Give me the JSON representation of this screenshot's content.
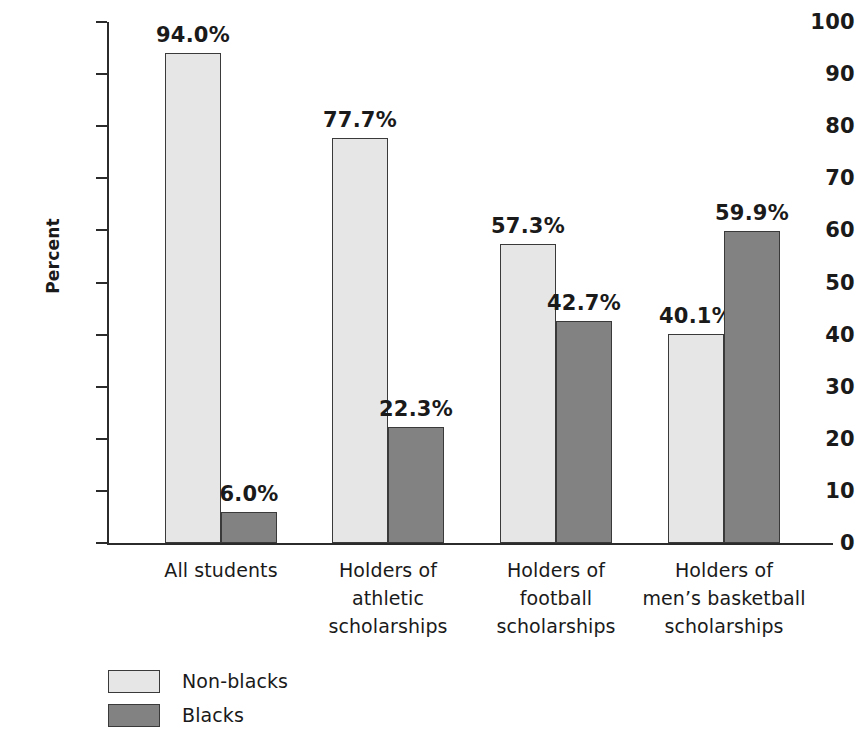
{
  "chart_data": {
    "type": "bar",
    "title": "",
    "xlabel": "",
    "ylabel": "Percent",
    "ylim": [
      0,
      100
    ],
    "ytick_step": 10,
    "yticks": [
      100,
      90,
      80,
      70,
      60,
      50,
      40,
      30,
      20,
      10,
      0
    ],
    "grid": false,
    "legend_position": "bottom-left",
    "value_label_suffix": "%",
    "categories": [
      "All students",
      "Holders of athletic scholarships",
      "Holders of football scholarships",
      "Holders of men’s basketball scholarships"
    ],
    "category_lines": [
      [
        "All students"
      ],
      [
        "Holders of",
        "athletic",
        "scholarships"
      ],
      [
        "Holders of",
        "football",
        "scholarships"
      ],
      [
        "Holders of",
        "men’s basketball",
        "scholarships"
      ]
    ],
    "series": [
      {
        "name": "Non-blacks",
        "color": "#e6e6e6",
        "values": [
          94.0,
          77.7,
          57.3,
          40.1
        ],
        "labels": [
          "94.0%",
          "77.7%",
          "57.3%",
          "40.1%"
        ]
      },
      {
        "name": "Blacks",
        "color": "#828282",
        "values": [
          6.0,
          22.3,
          42.7,
          59.9
        ],
        "labels": [
          "6.0%",
          "22.3%",
          "42.7%",
          "59.9%"
        ]
      }
    ]
  },
  "legend": {
    "entries": [
      {
        "label": "Non-blacks",
        "swatch": "light"
      },
      {
        "label": "Blacks",
        "swatch": "dark"
      }
    ]
  },
  "colors": {
    "series_light": "#e6e6e6",
    "series_dark": "#828282",
    "axis": "#2b2b2b",
    "bar_outline": "#3a3a3a",
    "text": "#1a1a1a",
    "background": "#ffffff"
  }
}
